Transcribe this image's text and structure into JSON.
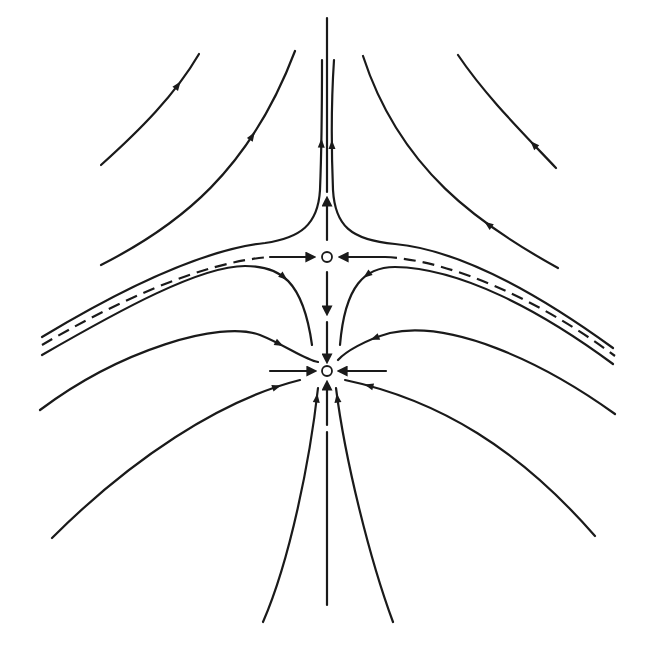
{
  "figure": {
    "type": "phase-portrait",
    "colors": {
      "ink": "#1a1a1a",
      "background": "#ffffff",
      "fixed_point_fill": "#ffffff"
    },
    "fixed_points": [
      {
        "name": "saddle-point",
        "kind": "saddle"
      },
      {
        "name": "stable-node",
        "kind": "stable node"
      }
    ],
    "separatrix": {
      "style": "dashed",
      "flow": "toward saddle"
    }
  }
}
